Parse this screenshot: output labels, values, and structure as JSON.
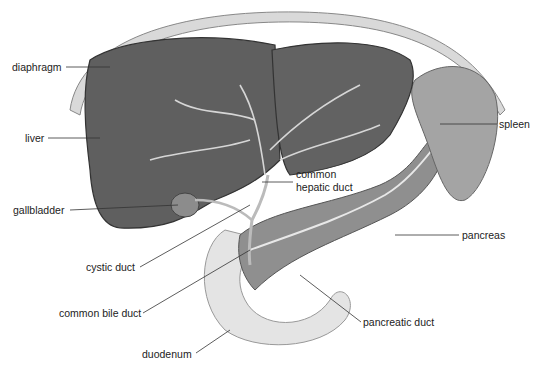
{
  "diagram": {
    "labels": {
      "diaphragm": "diaphragm",
      "liver": "liver",
      "gallbladder": "gallbladder",
      "cystic_duct": "cystic duct",
      "common_bile_duct": "common bile duct",
      "duodenum": "duodenum",
      "common_hepatic_duct_line1": "common",
      "common_hepatic_duct_line2": "hepatic duct",
      "spleen": "spleen",
      "pancreas": "pancreas",
      "pancreatic_duct": "pancreatic duct"
    },
    "colors": {
      "liver": "#5e5e5e",
      "liver_edge": "#3a3a3a",
      "diaphragm": "#cfcfcf",
      "pancreas": "#8a8a8a",
      "duodenum": "#e2e2e2",
      "spleen": "#9a9a9a",
      "vessels": "#d8d8d8",
      "leader_line": "#333333"
    }
  }
}
